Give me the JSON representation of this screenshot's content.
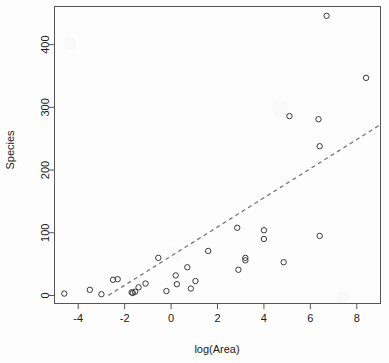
{
  "chart_data": {
    "type": "scatter",
    "title": "",
    "xlabel": "log(Area)",
    "ylabel": "Species",
    "xlim": [
      -5.0,
      9.0
    ],
    "ylim": [
      -12,
      460
    ],
    "grid": false,
    "legend": null,
    "xticks": [
      -4,
      -2,
      0,
      2,
      4,
      6,
      8
    ],
    "xtick_labels": [
      "-4",
      "-2",
      "0",
      "2",
      "4",
      "6",
      "8"
    ],
    "yticks": [
      0,
      100,
      200,
      300,
      400
    ],
    "ytick_labels": [
      "0",
      "100",
      "200",
      "300",
      "400"
    ],
    "point_marker": "open-circle",
    "point_color": "#3a3a3a",
    "line_color": "#6e6e6e",
    "line_style": "dashed",
    "trend_line": {
      "label": "dashed regression line",
      "x_start": -2.7,
      "y_start": 0,
      "x_end": 9.0,
      "y_end": 272
    },
    "points": [
      {
        "x": -4.6,
        "y": 3
      },
      {
        "x": -3.5,
        "y": 9
      },
      {
        "x": -3.0,
        "y": 2
      },
      {
        "x": -2.5,
        "y": 25
      },
      {
        "x": -2.3,
        "y": 26
      },
      {
        "x": -1.7,
        "y": 5
      },
      {
        "x": -1.65,
        "y": 4
      },
      {
        "x": -1.55,
        "y": 6
      },
      {
        "x": -1.4,
        "y": 13
      },
      {
        "x": -1.1,
        "y": 19
      },
      {
        "x": -0.55,
        "y": 60
      },
      {
        "x": -0.2,
        "y": 7
      },
      {
        "x": 0.2,
        "y": 32
      },
      {
        "x": 0.25,
        "y": 18
      },
      {
        "x": 0.7,
        "y": 45
      },
      {
        "x": 0.85,
        "y": 11
      },
      {
        "x": 1.05,
        "y": 23
      },
      {
        "x": 1.6,
        "y": 71
      },
      {
        "x": 2.85,
        "y": 108
      },
      {
        "x": 2.9,
        "y": 41
      },
      {
        "x": 3.2,
        "y": 60
      },
      {
        "x": 3.2,
        "y": 56
      },
      {
        "x": 4.0,
        "y": 104
      },
      {
        "x": 4.0,
        "y": 90
      },
      {
        "x": 4.85,
        "y": 53
      },
      {
        "x": 5.1,
        "y": 286
      },
      {
        "x": 6.35,
        "y": 281
      },
      {
        "x": 6.4,
        "y": 238
      },
      {
        "x": 6.4,
        "y": 95
      },
      {
        "x": 6.7,
        "y": 446
      },
      {
        "x": 8.4,
        "y": 347
      }
    ]
  }
}
